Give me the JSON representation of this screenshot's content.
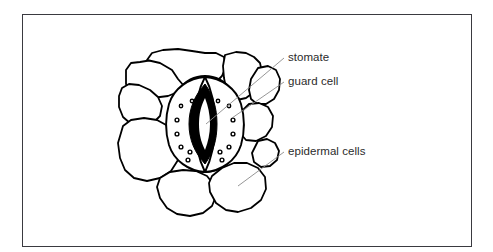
{
  "figure": {
    "kind": "biology-diagram",
    "background_color": "#ffffff",
    "border_color": "#3a3a40",
    "ink_color": "#000000",
    "leader_line_color": "#8a8a8a",
    "label_text_color": "#2b2b2b"
  },
  "labels": {
    "stomate": "stomate",
    "guard_cell": "guard cell",
    "epidermal_cells": "epidermal cells"
  },
  "structures": {
    "stomatal_pore": "stomatal-pore",
    "guard_cell_left": "guard-cell-left",
    "guard_cell_right": "guard-cell-right",
    "chloroplast_count": 14,
    "epidermal_cell_count": 9
  }
}
